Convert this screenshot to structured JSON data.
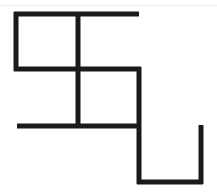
{
  "figure": {
    "stroke_color": "#1a1a1a",
    "stroke_width": 5,
    "background": "#ffffff"
  },
  "segments": [
    {
      "name": "top-horizontal",
      "x1": 14,
      "y1": 14,
      "x2": 139,
      "y2": 14
    },
    {
      "name": "left-vertical",
      "x1": 16,
      "y1": 12,
      "x2": 16,
      "y2": 71
    },
    {
      "name": "middle-vertical",
      "x1": 78,
      "y1": 12,
      "x2": 78,
      "y2": 128
    },
    {
      "name": "middle-horizontal",
      "x1": 14,
      "y1": 69,
      "x2": 141,
      "y2": 69
    },
    {
      "name": "right-inner-vertical",
      "x1": 139,
      "y1": 67,
      "x2": 139,
      "y2": 184
    },
    {
      "name": "lower-horizontal",
      "x1": 17,
      "y1": 126,
      "x2": 141,
      "y2": 126
    },
    {
      "name": "bottom-horizontal",
      "x1": 137,
      "y1": 182,
      "x2": 203,
      "y2": 182
    },
    {
      "name": "right-vertical",
      "x1": 201,
      "y1": 125,
      "x2": 201,
      "y2": 184
    }
  ]
}
